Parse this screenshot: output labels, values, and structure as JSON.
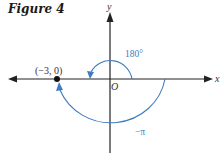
{
  "figure": {
    "title": "Figure 4",
    "axes": {
      "x_label": "x",
      "y_label": "y",
      "origin_label": "O"
    },
    "point": {
      "label": "(−3, 0)"
    },
    "arcs": [
      {
        "label": "180°",
        "direction": "counterclockwise",
        "radius": "small"
      },
      {
        "label": "−π",
        "direction": "clockwise",
        "radius": "large"
      }
    ],
    "colors": {
      "axis": "#222222",
      "arc": "#3d7cc0"
    }
  }
}
